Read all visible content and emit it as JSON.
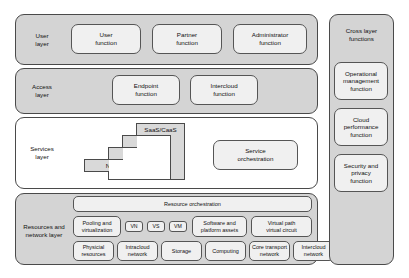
{
  "diagram": {
    "colors": {
      "layer_fill": "#d4d4d4",
      "layer_white_fill": "#ffffff",
      "box_fill": "#f0f0f0",
      "stack_fill": "#d9d9d9",
      "stroke": "#4a4a4a",
      "text": "#111111",
      "page_background": "#ffffff"
    }
  },
  "layers": {
    "user": {
      "label": "User\nlayer",
      "boxes": [
        {
          "label": "User\nfunction"
        },
        {
          "label": "Partner\nfunction"
        },
        {
          "label": "Administrator\nfunction"
        }
      ]
    },
    "access": {
      "label": "Access\nlayer",
      "boxes": [
        {
          "label": "Endpoint\nfunction"
        },
        {
          "label": "Intercloud\nfunction"
        }
      ]
    },
    "services": {
      "label": "Services\nlayer",
      "stack": [
        {
          "label": "SaaS/CaaS"
        },
        {
          "label": "PaaS"
        },
        {
          "label": "IaaS"
        },
        {
          "label": "NaaS"
        }
      ],
      "orchestration": {
        "label": "Service\norchestration"
      }
    },
    "resources": {
      "label": "Resources and\nnetwork layer",
      "orchestration": {
        "label": "Resource orchestration"
      },
      "row_middle": [
        {
          "label": "Pooling and\nvirtualization"
        },
        {
          "label": "VN"
        },
        {
          "label": "VS"
        },
        {
          "label": "VM"
        },
        {
          "label": "Software and\nplatform assets"
        },
        {
          "label": "Virtual path\nvirtual circuit"
        }
      ],
      "row_bottom": [
        {
          "label": "Physicial\nresources"
        },
        {
          "label": "Intracloud\nnetwork"
        },
        {
          "label": "Storage"
        },
        {
          "label": "Computing"
        },
        {
          "label": "Core transport\nnetwork"
        },
        {
          "label": "Intercloud\nnetwork"
        }
      ]
    }
  },
  "cross_layer": {
    "label": "Cross layer\nfunctions",
    "boxes": [
      {
        "label": "Operational\nmanagement\nfunction"
      },
      {
        "label": "Cloud\nperformance\nfunction"
      },
      {
        "label": "Security and\nprivacy\nfunction"
      }
    ]
  }
}
